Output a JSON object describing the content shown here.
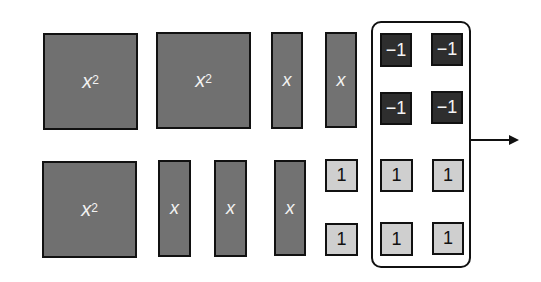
{
  "diagram": {
    "title": "",
    "colors": {
      "x_squared": "#707070",
      "x": "#727272",
      "negative_one": "#2e2e2e",
      "positive_one": "#cfcfcf",
      "border": "#111111",
      "background": "#ffffff"
    },
    "tiles": {
      "x_squared_label": "x",
      "x_squared_exponent": "2",
      "x_label": "x",
      "neg_one_label": "−1",
      "one_label": "1"
    },
    "counts": {
      "x_squared": 3,
      "x": 5,
      "positive_one": 6,
      "negative_one": 4
    },
    "group": {
      "label": "",
      "contains": "four -1 tiles and four +1 tiles"
    },
    "arrow": {
      "direction": "right"
    }
  }
}
